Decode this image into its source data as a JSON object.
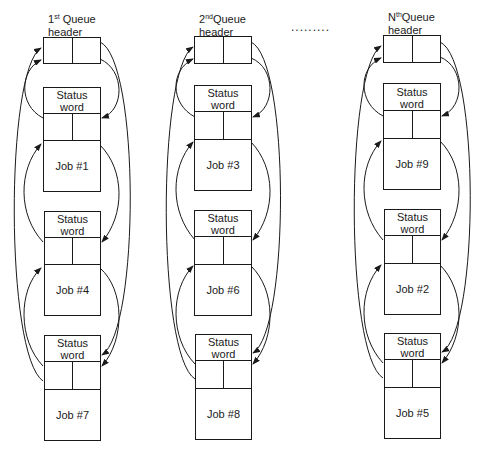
{
  "queues": [
    {
      "label_prefix": "1",
      "label_sup": "st",
      "label_rest": " Queue",
      "label_line2": "header",
      "jobs": [
        {
          "status_line1": "Status",
          "status_line2": "word",
          "job": "Job #1"
        },
        {
          "status_line1": "Status",
          "status_line2": "word",
          "job": "Job #4"
        },
        {
          "status_line1": "Status",
          "status_line2": "word",
          "job": "Job #7"
        }
      ]
    },
    {
      "label_prefix": "2",
      "label_sup": "nd",
      "label_rest": "Queue",
      "label_line2": "header",
      "jobs": [
        {
          "status_line1": "Status",
          "status_line2": "word",
          "job": "Job #3"
        },
        {
          "status_line1": "Status",
          "status_line2": "word",
          "job": "Job #6"
        },
        {
          "status_line1": "Status",
          "status_line2": "word",
          "job": "Job #8"
        }
      ]
    },
    {
      "label_prefix": "N",
      "label_sup": "th",
      "label_rest": "Queue",
      "label_line2": "header",
      "jobs": [
        {
          "status_line1": "Status",
          "status_line2": "word",
          "job": "Job #9"
        },
        {
          "status_line1": "Status",
          "status_line2": "word",
          "job": "Job #2"
        },
        {
          "status_line1": "Status",
          "status_line2": "word",
          "job": "Job #5"
        }
      ]
    }
  ],
  "ellipsis": ".........",
  "colors": {
    "line": "#1a1a1a",
    "background": "#ffffff"
  }
}
